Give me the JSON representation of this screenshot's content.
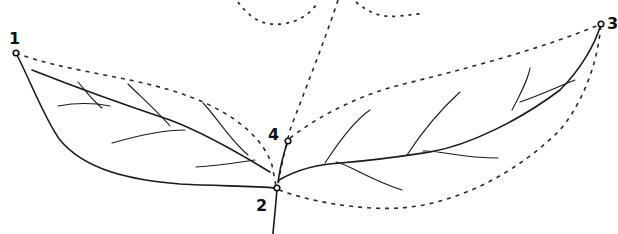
{
  "diagram": {
    "type": "leaf-measurement-diagram",
    "points": [
      {
        "id": "1",
        "label": "1",
        "x": 16,
        "y": 53
      },
      {
        "id": "2",
        "label": "2",
        "x": 277,
        "y": 188
      },
      {
        "id": "3",
        "label": "3",
        "x": 601,
        "y": 24
      },
      {
        "id": "4",
        "label": "4",
        "x": 288,
        "y": 141
      }
    ],
    "colors": {
      "line": "#1a1a1a",
      "background": "#ffffff"
    }
  }
}
